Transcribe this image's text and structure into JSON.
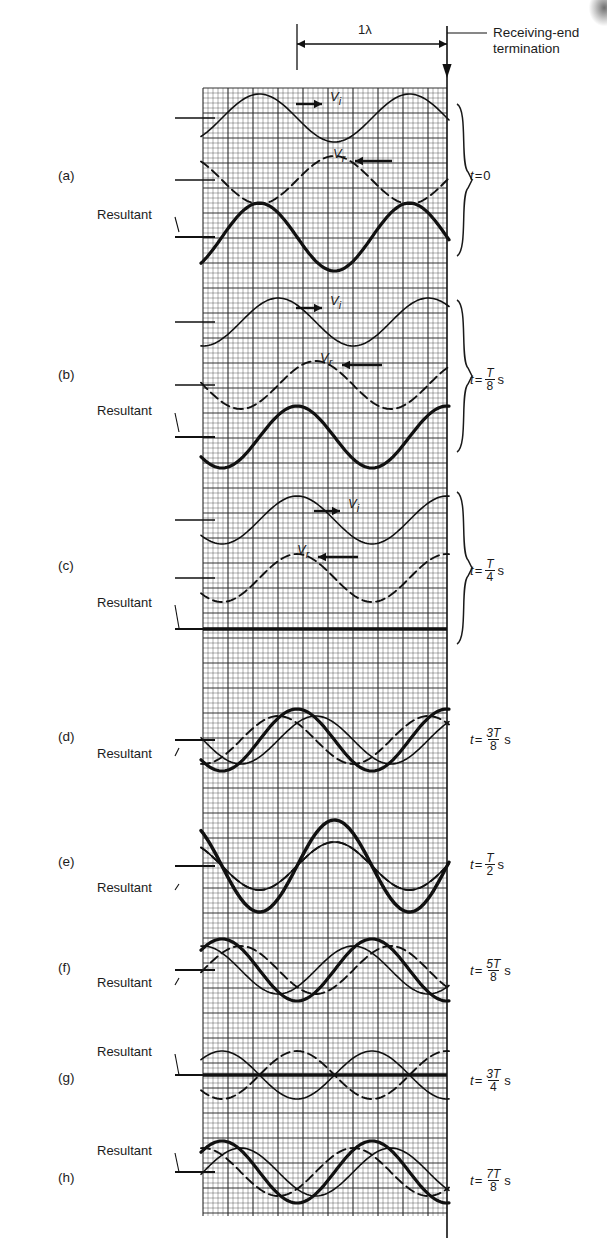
{
  "figure": {
    "title_note_line1": "Receiving-end",
    "title_note_line2": "termination",
    "wavelength_label": "1λ",
    "incident_symbol": "V",
    "incident_sub": "i",
    "reflected_symbol": "V",
    "reflected_sub": "r",
    "resultant_label": "Resultant",
    "time_prefix": "t",
    "equals": "=",
    "seconds_unit": "s",
    "period_symbol": "T"
  },
  "geometry": {
    "grid_left": 203,
    "grid_right": 447,
    "grid_top": 88,
    "grid_bottom": 1216,
    "minor_step": 5,
    "major_step": 25,
    "wavelength_px": 150,
    "grid_color": "#2a2a2a",
    "wave_color": "#111111",
    "termination_x": 447
  },
  "panels": [
    {
      "letter": "(a)",
      "letter_y": 176,
      "time_value": "0",
      "time_kind": "zero",
      "time_y": 178,
      "brace": {
        "top": 104,
        "bottom": 256
      },
      "resultant_label_y": 216,
      "resultant_leader_to_y": 232,
      "traces": [
        {
          "name": "incident",
          "style": "solid",
          "axis_y": 118,
          "amp": 24,
          "phase_deg": 0,
          "weight": 1.6
        },
        {
          "name": "reflected",
          "style": "dashed",
          "axis_y": 180,
          "amp": 24,
          "phase_deg": 180,
          "weight": 1.9
        },
        {
          "name": "resultant",
          "style": "solid",
          "axis_y": 237,
          "amp": 34,
          "phase_deg": 0,
          "weight": 3.2
        }
      ],
      "vi_label": {
        "x": 330,
        "y": 98,
        "arrow_from": 296,
        "arrow_to": 322,
        "dir": "right"
      },
      "vr_label": {
        "x": 333,
        "y": 155,
        "arrow_from": 355,
        "arrow_to": 392,
        "dir": "left"
      }
    },
    {
      "letter": "(b)",
      "letter_y": 375,
      "time_value": "T/8",
      "time_kind": "frac",
      "time_num": "T",
      "time_den": "8",
      "time_y": 377,
      "brace": {
        "top": 300,
        "bottom": 452
      },
      "resultant_label_y": 412,
      "resultant_leader_to_y": 432,
      "traces": [
        {
          "name": "incident",
          "style": "solid",
          "axis_y": 322,
          "amp": 24,
          "phase_deg": 45,
          "weight": 1.6
        },
        {
          "name": "reflected",
          "style": "dashed",
          "axis_y": 385,
          "amp": 24,
          "phase_deg": 135,
          "weight": 1.9
        },
        {
          "name": "resultant",
          "style": "solid",
          "axis_y": 437,
          "amp": 31,
          "phase_deg": 90,
          "weight": 3.2
        }
      ],
      "vi_label": {
        "x": 330,
        "y": 302,
        "arrow_from": 296,
        "arrow_to": 322,
        "dir": "right"
      },
      "vr_label": {
        "x": 320,
        "y": 359,
        "arrow_from": 342,
        "arrow_to": 382,
        "dir": "left"
      }
    },
    {
      "letter": "(c)",
      "letter_y": 566,
      "time_value": "T/4",
      "time_kind": "frac",
      "time_num": "T",
      "time_den": "4",
      "time_y": 568,
      "brace": {
        "top": 492,
        "bottom": 644
      },
      "resultant_label_y": 604,
      "resultant_leader_to_y": 628,
      "traces": [
        {
          "name": "incident",
          "style": "solid",
          "axis_y": 520,
          "amp": 24,
          "phase_deg": 90,
          "weight": 1.6
        },
        {
          "name": "reflected",
          "style": "dashed",
          "axis_y": 578,
          "amp": 24,
          "phase_deg": 90,
          "weight": 1.9
        },
        {
          "name": "resultant",
          "style": "flat",
          "axis_y": 629,
          "amp": 0,
          "phase_deg": 0,
          "weight": 3.4
        }
      ],
      "vi_label": {
        "x": 348,
        "y": 505,
        "arrow_from": 314,
        "arrow_to": 340,
        "dir": "right"
      },
      "vr_label": {
        "x": 297,
        "y": 551,
        "arrow_from": 318,
        "arrow_to": 358,
        "dir": "left"
      }
    },
    {
      "letter": "(d)",
      "letter_y": 737,
      "time_value": "3T/8",
      "time_kind": "frac",
      "time_num": "3T",
      "time_den": "8",
      "time_y": 737,
      "brace": null,
      "resultant_label_y": 755,
      "resultant_leader_to_y": 748,
      "traces": [
        {
          "name": "incident",
          "style": "solid",
          "axis_y": 740,
          "amp": 24,
          "phase_deg": 135,
          "weight": 1.6
        },
        {
          "name": "reflected",
          "style": "dashed",
          "axis_y": 740,
          "amp": 24,
          "phase_deg": 45,
          "weight": 1.9
        },
        {
          "name": "resultant",
          "style": "solid",
          "axis_y": 740,
          "amp": 31,
          "phase_deg": 90,
          "weight": 3.2
        }
      ],
      "vi_label": null,
      "vr_label": null
    },
    {
      "letter": "(e)",
      "letter_y": 862,
      "time_value": "T/2",
      "time_kind": "frac",
      "time_num": "T",
      "time_den": "2",
      "time_y": 862,
      "brace": null,
      "resultant_label_y": 889,
      "resultant_leader_to_y": 884,
      "traces": [
        {
          "name": "incident",
          "style": "solid",
          "axis_y": 866,
          "amp": 24,
          "phase_deg": 180,
          "weight": 1.6
        },
        {
          "name": "reflected",
          "style": "dashed",
          "axis_y": 866,
          "amp": 24,
          "phase_deg": 180,
          "weight": 1.9
        },
        {
          "name": "resultant",
          "style": "solid",
          "axis_y": 866,
          "amp": 46,
          "phase_deg": 180,
          "weight": 3.4
        }
      ],
      "vi_label": null,
      "vr_label": null
    },
    {
      "letter": "(f)",
      "letter_y": 968,
      "time_value": "5T/8",
      "time_kind": "frac",
      "time_num": "5T",
      "time_den": "8",
      "time_y": 968,
      "brace": null,
      "resultant_label_y": 984,
      "resultant_leader_to_y": 978,
      "traces": [
        {
          "name": "incident",
          "style": "solid",
          "axis_y": 970,
          "amp": 24,
          "phase_deg": 225,
          "weight": 1.6
        },
        {
          "name": "reflected",
          "style": "dashed",
          "axis_y": 970,
          "amp": 24,
          "phase_deg": 315,
          "weight": 1.9
        },
        {
          "name": "resultant",
          "style": "solid",
          "axis_y": 970,
          "amp": 31,
          "phase_deg": 270,
          "weight": 3.2
        }
      ],
      "vi_label": null,
      "vr_label": null
    },
    {
      "letter": "(g)",
      "letter_y": 1078,
      "time_value": "3T/4",
      "time_kind": "frac",
      "time_num": "3T",
      "time_den": "4",
      "time_y": 1078,
      "brace": null,
      "resultant_label_y": 1053,
      "resultant_leader_to_y": 1075,
      "traces": [
        {
          "name": "incident",
          "style": "solid",
          "axis_y": 1075,
          "amp": 24,
          "phase_deg": 270,
          "weight": 1.6
        },
        {
          "name": "reflected",
          "style": "dashed",
          "axis_y": 1075,
          "amp": 24,
          "phase_deg": 90,
          "weight": 1.9
        },
        {
          "name": "resultant",
          "style": "flat",
          "axis_y": 1075,
          "amp": 0,
          "phase_deg": 0,
          "weight": 3.4
        }
      ],
      "vi_label": null,
      "vr_label": null
    },
    {
      "letter": "(h)",
      "letter_y": 1178,
      "time_value": "7T/8",
      "time_kind": "frac",
      "time_num": "7T",
      "time_den": "8",
      "time_y": 1178,
      "brace": null,
      "resultant_label_y": 1152,
      "resultant_leader_to_y": 1172,
      "traces": [
        {
          "name": "incident",
          "style": "solid",
          "axis_y": 1172,
          "amp": 24,
          "phase_deg": 315,
          "weight": 1.6
        },
        {
          "name": "reflected",
          "style": "dashed",
          "axis_y": 1172,
          "amp": 24,
          "phase_deg": 225,
          "weight": 1.9
        },
        {
          "name": "resultant",
          "style": "solid",
          "axis_y": 1172,
          "amp": 31,
          "phase_deg": 270,
          "weight": 3.2
        }
      ],
      "vi_label": null,
      "vr_label": null
    }
  ],
  "chart_data": {
    "type": "line",
    "xlabel": "Distance along line (wavelengths)",
    "ylabel": "Voltage",
    "x_range_wavelengths": [
      0,
      1.63
    ],
    "grid": true,
    "legend": [
      "Vi (incident, solid)",
      "Vr (reflected, dashed)",
      "Resultant (heavy solid)"
    ],
    "annotations": [
      "1λ",
      "Receiving-end termination"
    ],
    "series": [
      {
        "name": "t = 0",
        "incident_phase_deg": 0,
        "reflected_phase_deg": 180,
        "resultant_amplitude_rel": 1.4
      },
      {
        "name": "t = T/8",
        "incident_phase_deg": 45,
        "reflected_phase_deg": 135,
        "resultant_amplitude_rel": 1.3
      },
      {
        "name": "t = T/4",
        "incident_phase_deg": 90,
        "reflected_phase_deg": 90,
        "resultant_amplitude_rel": 0.0
      },
      {
        "name": "t = 3T/8",
        "incident_phase_deg": 135,
        "reflected_phase_deg": 45,
        "resultant_amplitude_rel": 1.3
      },
      {
        "name": "t = T/2",
        "incident_phase_deg": 180,
        "reflected_phase_deg": 180,
        "resultant_amplitude_rel": 2.0
      },
      {
        "name": "t = 5T/8",
        "incident_phase_deg": 225,
        "reflected_phase_deg": 315,
        "resultant_amplitude_rel": 1.3
      },
      {
        "name": "t = 3T/4",
        "incident_phase_deg": 270,
        "reflected_phase_deg": 90,
        "resultant_amplitude_rel": 0.0
      },
      {
        "name": "t = 7T/8",
        "incident_phase_deg": 315,
        "reflected_phase_deg": 225,
        "resultant_amplitude_rel": 1.3
      }
    ]
  }
}
